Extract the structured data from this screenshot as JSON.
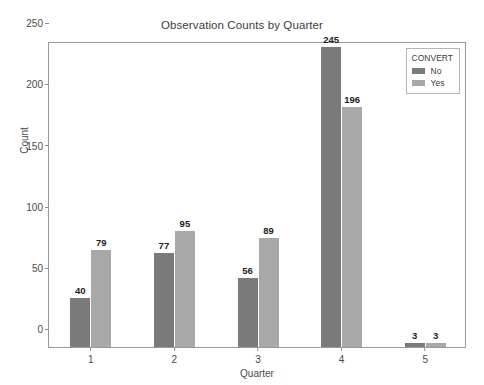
{
  "chart_data": {
    "type": "bar",
    "title": "Observation Counts by Quarter",
    "xlabel": "Quarter",
    "ylabel": "Count",
    "categories": [
      "1",
      "2",
      "3",
      "4",
      "5"
    ],
    "series": [
      {
        "name": "No",
        "color": "#7a7a7a",
        "values": [
          40,
          77,
          56,
          245,
          3
        ]
      },
      {
        "name": "Yes",
        "color": "#a8a8a8",
        "values": [
          79,
          95,
          89,
          196,
          3
        ]
      }
    ],
    "ylim": [
      0,
      250
    ],
    "yticks": [
      0,
      50,
      100,
      150,
      200,
      250
    ],
    "grid": false,
    "legend_position": "top-right-inside",
    "legend_title": "CONVERT",
    "value_labels": true
  }
}
